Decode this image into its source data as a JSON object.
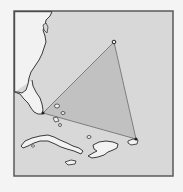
{
  "map": {
    "subject": "Bermuda Triangle",
    "colors": {
      "page_bg": "#f4f4f4",
      "sea": "#d8d8d8",
      "land": "#f2f2f2",
      "triangle_fill": "#bdbdbd",
      "outline": "#3a3a3a",
      "frame": "#5a5a5a"
    },
    "vertices": [
      {
        "name": "Miami",
        "x": 43,
        "y": 113
      },
      {
        "name": "Bermuda",
        "x": 114,
        "y": 42
      },
      {
        "name": "Puerto Rico",
        "x": 136,
        "y": 139
      }
    ]
  }
}
